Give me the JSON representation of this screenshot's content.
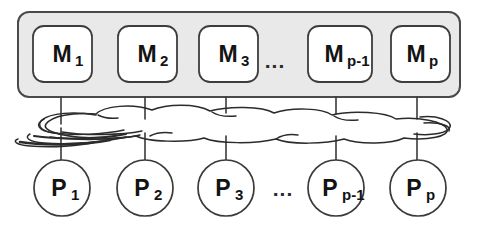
{
  "figure": {
    "kind": "shared-memory-multiprocessor-diagram",
    "colors": {
      "background": "#ffffff",
      "memory_bank_fill": "#e9e9e9",
      "memory_bank_stroke": "#4a4a4a",
      "module_fill": "#ffffff",
      "module_stroke": "#3d3d3d",
      "processor_fill": "#ffffff",
      "processor_stroke": "#3a3a3a",
      "network_stroke": "#2b2b2b",
      "link_stroke": "#3a3a3a",
      "text": "#131313"
    }
  },
  "memory_bank": {
    "name": "memory-modules-group",
    "modules": [
      {
        "id": "m1",
        "base": "M",
        "sub": "1",
        "x": 33,
        "y": 26,
        "w": 59,
        "h": 56
      },
      {
        "id": "m2",
        "base": "M",
        "sub": "2",
        "x": 118,
        "y": 26,
        "w": 59,
        "h": 56
      },
      {
        "id": "m3",
        "base": "M",
        "sub": "3",
        "x": 199,
        "y": 26,
        "w": 59,
        "h": 56
      },
      {
        "id": "mp-1",
        "base": "M",
        "sub": "p-1",
        "x": 308,
        "y": 26,
        "w": 64,
        "h": 56
      },
      {
        "id": "mp",
        "base": "M",
        "sub": "p",
        "x": 391,
        "y": 26,
        "w": 59,
        "h": 56
      }
    ],
    "ellipsis": {
      "text": "...",
      "x": 275,
      "y": 62
    }
  },
  "network": {
    "name": "interconnection-network-cloud",
    "label": ""
  },
  "processors": {
    "name": "processors-group",
    "nodes": [
      {
        "id": "p1",
        "base": "P",
        "sub": "1",
        "cx": 62,
        "cy": 188,
        "r": 28
      },
      {
        "id": "p2",
        "base": "P",
        "sub": "2",
        "cx": 145,
        "cy": 188,
        "r": 28
      },
      {
        "id": "p3",
        "base": "P",
        "sub": "3",
        "cx": 226,
        "cy": 188,
        "r": 28
      },
      {
        "id": "pp-1",
        "base": "P",
        "sub": "p-1",
        "cx": 336,
        "cy": 188,
        "r": 28
      },
      {
        "id": "pp",
        "base": "P",
        "sub": "p",
        "cx": 418,
        "cy": 188,
        "r": 28
      }
    ],
    "ellipsis": {
      "text": "...",
      "x": 283,
      "y": 192
    }
  },
  "links": {
    "name": "connection-links",
    "memory_to_network": [
      {
        "x": 61,
        "y1": 97,
        "y2": 122
      },
      {
        "x": 145,
        "y1": 97,
        "y2": 118
      },
      {
        "x": 226,
        "y1": 97,
        "y2": 113
      },
      {
        "x": 336,
        "y1": 97,
        "y2": 114
      },
      {
        "x": 417,
        "y1": 97,
        "y2": 118
      }
    ],
    "network_to_processor": [
      {
        "x": 61,
        "y1": 130,
        "y2": 160
      },
      {
        "x": 145,
        "y1": 134,
        "y2": 160
      },
      {
        "x": 226,
        "y1": 137,
        "y2": 160
      },
      {
        "x": 336,
        "y1": 136,
        "y2": 160
      },
      {
        "x": 417,
        "y1": 133,
        "y2": 160
      }
    ]
  }
}
